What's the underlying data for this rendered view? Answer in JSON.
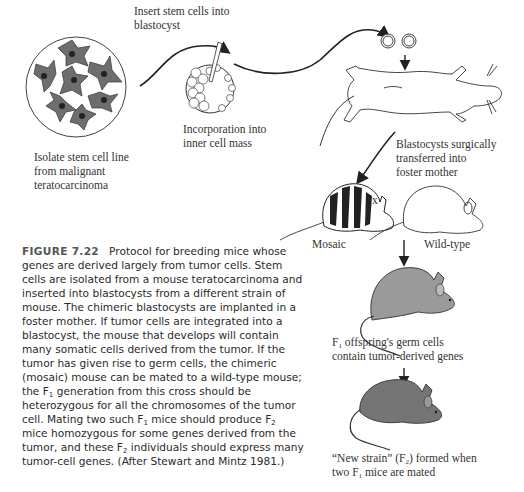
{
  "figure": {
    "number": "FIGURE 7.22",
    "caption_parts": {
      "p1": "Protocol for breeding mice whose genes are derived largely from tumor cells. Stem cells are isolated from a mouse teratocarcinoma and inserted into blastocysts from a different strain of mouse. The chimeric blastocysts are implanted in a foster mother. If tumor cells are integrated into a blastocyst, the mouse that develops will contain many somatic cells derived from the tumor. If the tumor has given rise to germ cells, the chimeric (mosaic) mouse can be mated to a wild-type mouse; the F",
      "sub1": "1",
      "p2": " generation from this cross should be heterozygous for all the chromosomes of the tumor cell. Mating two such F",
      "sub2": "1",
      "p3": " mice should produce F",
      "sub3": "2",
      "p4": " mice homozygous for some genes derived from the tumor, and these F",
      "sub4": "2",
      "p5": " individuals should express many tumor-cell genes. (After Stewart and Mintz 1981.)"
    }
  },
  "labels": {
    "isolate": [
      "Isolate stem cell line",
      "from malignant",
      "teratocarcinoma"
    ],
    "insert": [
      "Insert stem cells into",
      "blastocyst"
    ],
    "incorporation": [
      "Incorporation into",
      "inner cell mass"
    ],
    "surgical": [
      "Blastocysts surgically",
      "transferred into",
      "foster mother"
    ],
    "mosaic": "Mosaic",
    "cross": "x",
    "wildtype": "Wild-type",
    "f1_a": "F",
    "f1_sub": "1",
    "f1_rest": " offspring's germ cells",
    "f1_line2": "contain tumor-derived genes",
    "f2_a": "“New strain” (F",
    "f2_sub": "2",
    "f2_rest": ") formed when",
    "f2_line2_a": "two F",
    "f2_line2_sub": "1",
    "f2_line2_rest": " mice are mated"
  },
  "colors": {
    "ink": "#222222",
    "cell_fill": "#6e6e6e",
    "mouse_gray": "#8c8c8c",
    "f2_gray": "#6f6f6f"
  }
}
